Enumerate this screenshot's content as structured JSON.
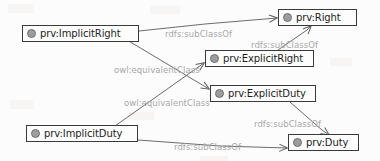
{
  "diagram": {
    "type": "rdf-class-hierarchy-graph",
    "width": 380,
    "height": 161,
    "colors": {
      "node_border": "#3a3a3a",
      "node_fill": "#fdfdfd",
      "node_icon": "#9d9d9d",
      "edge_line": "#6b6b6b",
      "edge_label_text": "#a8a8a8",
      "background": "#fcfcfc"
    },
    "nodes": [
      {
        "id": "implicit-right",
        "label": "prv:ImplicitRight",
        "icon": "class-node-icon",
        "x": 22,
        "y": 25,
        "w": 117
      },
      {
        "id": "right",
        "label": "prv:Right",
        "icon": "class-node-icon",
        "x": 278,
        "y": 9,
        "w": 79
      },
      {
        "id": "explicit-right",
        "label": "prv:ExplicitRight",
        "icon": "class-node-icon",
        "x": 205,
        "y": 50,
        "w": 109
      },
      {
        "id": "explicit-duty",
        "label": "prv:ExplicitDuty",
        "icon": "class-node-icon",
        "x": 210,
        "y": 85,
        "w": 106
      },
      {
        "id": "implicit-duty",
        "label": "prv:ImplicitDuty",
        "icon": "class-node-icon",
        "x": 26,
        "y": 125,
        "w": 112
      },
      {
        "id": "duty",
        "label": "prv:Duty",
        "icon": "class-node-icon",
        "x": 288,
        "y": 134,
        "w": 71
      }
    ],
    "edges": [
      {
        "id": "e1",
        "from": "implicit-right",
        "to": "right",
        "label": "rdfs:subClassOf",
        "label_x": 165,
        "label_y": 30
      },
      {
        "id": "e2",
        "from": "explicit-right",
        "to": "right",
        "label": "rdfs:subClassOf",
        "label_x": 251,
        "label_y": 41
      },
      {
        "id": "e3",
        "from": "implicit-right",
        "to": "explicit-duty",
        "label": "owl:equivalentClass",
        "label_x": 114,
        "label_y": 66
      },
      {
        "id": "e4",
        "from": "implicit-duty",
        "to": "explicit-right",
        "label": "owl:equivalentClass",
        "label_x": 124,
        "label_y": 99
      },
      {
        "id": "e5",
        "from": "explicit-duty",
        "to": "duty",
        "label": "rdfs:subClassOf",
        "label_x": 254,
        "label_y": 120
      },
      {
        "id": "e6",
        "from": "implicit-duty",
        "to": "duty",
        "label": "rdfs:subClassOf",
        "label_x": 174,
        "label_y": 143
      }
    ]
  }
}
